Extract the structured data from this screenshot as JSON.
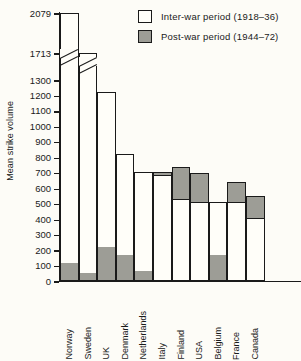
{
  "chart_data": {
    "type": "bar",
    "title": "",
    "xlabel": "",
    "ylabel": "Mean strike volume",
    "stacked": true,
    "grid": false,
    "legend_position": "top-right",
    "ylim": [
      0,
      2079
    ],
    "y_ticks": [
      0,
      100,
      200,
      300,
      400,
      500,
      600,
      700,
      800,
      900,
      1000,
      1100,
      1200,
      1300,
      1713,
      2079
    ],
    "axis_break": {
      "below": 1300,
      "above": 1713,
      "note": "scale break between 1300 and 1713"
    },
    "categories": [
      "Norway",
      "Sweden",
      "UK",
      "Denmark",
      "Netherlands",
      "Italy",
      "Finland",
      "USA",
      "Belgium",
      "France",
      "Canada"
    ],
    "series": [
      {
        "name": "Inter-war period (1918–36)",
        "color": "#fffef9",
        "values": [
          1974,
          1668,
          1013,
          658,
          645,
          680,
          525,
          510,
          350,
          510,
          405
        ]
      },
      {
        "name": "Post-war period (1944–72)",
        "color": "#9d9d96",
        "values": [
          105,
          45,
          210,
          162,
          55,
          25,
          210,
          185,
          160,
          128,
          140
        ]
      }
    ],
    "totals": [
      2079,
      1713,
      1223,
      820,
      700,
      705,
      735,
      695,
      510,
      638,
      545
    ]
  },
  "axis": {
    "y_title": "Mean strike volume",
    "tick_labels": [
      "2079",
      "1713",
      "1300",
      "1200",
      "1100",
      "1000",
      "900",
      "800",
      "700",
      "600",
      "500",
      "400",
      "300",
      "200",
      "100",
      "0"
    ]
  },
  "legend": {
    "items": [
      {
        "label": "Inter-war period (1918–36)",
        "swatch": "white-square"
      },
      {
        "label": "Post-war period (1944–72)",
        "swatch": "gray-square"
      }
    ]
  },
  "colors": {
    "background": "#fdfcf7",
    "ink": "#1a1a1a",
    "inter_war_fill": "#fffef9",
    "post_war_fill": "#9d9d96"
  }
}
